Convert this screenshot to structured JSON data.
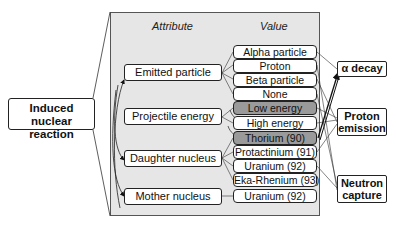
{
  "root": {
    "label_line1": "Induced nuclear",
    "label_line2": "reaction"
  },
  "columns": {
    "attribute": "Attribute",
    "value": "Value"
  },
  "attributes": [
    {
      "label": "Emitted particle"
    },
    {
      "label": "Projectile energy"
    },
    {
      "label": "Daughter nucleus"
    },
    {
      "label": "Mother nucleus"
    }
  ],
  "values": [
    {
      "label": "Alpha particle",
      "shaded": false
    },
    {
      "label": "Proton",
      "shaded": false
    },
    {
      "label": "Beta particle",
      "shaded": false
    },
    {
      "label": "None",
      "shaded": false
    },
    {
      "label": "Low energy",
      "shaded": true
    },
    {
      "label": "High energy",
      "shaded": false
    },
    {
      "label": "Thorium (90)",
      "shaded": true
    },
    {
      "label": "Protactinium (91)",
      "shaded": false
    },
    {
      "label": "Uranium (92)",
      "shaded": false
    },
    {
      "label": "Eka-Rhenium (93)",
      "shaded": false
    },
    {
      "label": "Uranium (92)",
      "shaded": false
    }
  ],
  "outcomes": [
    {
      "label": "α decay"
    },
    {
      "label_line1": "Proton",
      "label_line2": "emission"
    },
    {
      "label_line1": "Neutron",
      "label_line2": "capture"
    }
  ],
  "colors": {
    "panel": "#e6e6e6",
    "shaded_value": "#9a9a9a",
    "border": "#222222"
  }
}
